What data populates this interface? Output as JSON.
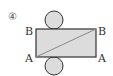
{
  "figure": {
    "number_label": "④",
    "corner_labels": {
      "top_left": "B",
      "top_right": "B",
      "bottom_left": "A",
      "bottom_right": "A"
    },
    "shapes": {
      "rectangle": {
        "fill": "#dcdcdc",
        "stroke": "#333333"
      },
      "top_circle": {
        "fill": "#dcdcdc",
        "stroke": "#333333"
      },
      "bottom_circle": {
        "fill": "#dcdcdc",
        "stroke": "#333333"
      },
      "diagonal": {
        "from": "bottom-left",
        "to": "top-right",
        "stroke": "#888888"
      }
    }
  }
}
